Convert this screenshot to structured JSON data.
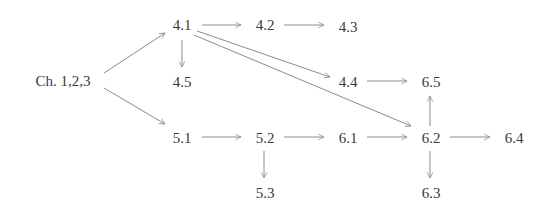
{
  "diagram": {
    "type": "dependency-graph",
    "nodes": [
      {
        "id": "ch123",
        "label": "Ch.  1,2,3",
        "x": 63,
        "y": 81
      },
      {
        "id": "4.1",
        "label": "4.1",
        "x": 182,
        "y": 25
      },
      {
        "id": "4.2",
        "label": "4.2",
        "x": 265,
        "y": 25
      },
      {
        "id": "4.3",
        "label": "4.3",
        "x": 348,
        "y": 27
      },
      {
        "id": "4.5",
        "label": "4.5",
        "x": 182,
        "y": 82
      },
      {
        "id": "4.4",
        "label": "4.4",
        "x": 348,
        "y": 82
      },
      {
        "id": "6.5",
        "label": "6.5",
        "x": 431,
        "y": 82
      },
      {
        "id": "5.1",
        "label": "5.1",
        "x": 182,
        "y": 138
      },
      {
        "id": "5.2",
        "label": "5.2",
        "x": 265,
        "y": 138
      },
      {
        "id": "6.1",
        "label": "6.1",
        "x": 348,
        "y": 138
      },
      {
        "id": "6.2",
        "label": "6.2",
        "x": 431,
        "y": 138
      },
      {
        "id": "6.4",
        "label": "6.4",
        "x": 514,
        "y": 138
      },
      {
        "id": "5.3",
        "label": "5.3",
        "x": 265,
        "y": 193
      },
      {
        "id": "6.3",
        "label": "6.3",
        "x": 431,
        "y": 193
      }
    ],
    "edges": [
      {
        "from": "ch123",
        "to": "4.1",
        "x1": 104,
        "y1": 73,
        "x2": 165,
        "y2": 33
      },
      {
        "from": "ch123",
        "to": "5.1",
        "x1": 104,
        "y1": 88,
        "x2": 165,
        "y2": 124
      },
      {
        "from": "4.1",
        "to": "4.2",
        "x1": 202,
        "y1": 25,
        "x2": 241,
        "y2": 25
      },
      {
        "from": "4.2",
        "to": "4.3",
        "x1": 284,
        "y1": 25,
        "x2": 324,
        "y2": 25
      },
      {
        "from": "4.1",
        "to": "4.5",
        "x1": 182,
        "y1": 40,
        "x2": 182,
        "y2": 67
      },
      {
        "from": "4.1",
        "to": "4.4",
        "x1": 197,
        "y1": 31,
        "x2": 330,
        "y2": 77
      },
      {
        "from": "4.1",
        "to": "6.2",
        "x1": 194,
        "y1": 35,
        "x2": 411,
        "y2": 126
      },
      {
        "from": "4.4",
        "to": "6.5",
        "x1": 367,
        "y1": 81,
        "x2": 407,
        "y2": 81
      },
      {
        "from": "6.2",
        "to": "6.5",
        "x1": 430,
        "y1": 126,
        "x2": 430,
        "y2": 96
      },
      {
        "from": "5.1",
        "to": "5.2",
        "x1": 202,
        "y1": 137,
        "x2": 241,
        "y2": 137
      },
      {
        "from": "5.2",
        "to": "5.3",
        "x1": 264,
        "y1": 151,
        "x2": 264,
        "y2": 178
      },
      {
        "from": "5.2",
        "to": "6.1",
        "x1": 284,
        "y1": 137,
        "x2": 324,
        "y2": 137
      },
      {
        "from": "6.1",
        "to": "6.2",
        "x1": 367,
        "y1": 137,
        "x2": 407,
        "y2": 137
      },
      {
        "from": "6.2",
        "to": "6.4",
        "x1": 450,
        "y1": 137,
        "x2": 490,
        "y2": 137
      },
      {
        "from": "6.2",
        "to": "6.3",
        "x1": 430,
        "y1": 151,
        "x2": 430,
        "y2": 178
      }
    ]
  },
  "colors": {
    "text": "#3a3a3a",
    "edge": "#8c8c8c",
    "background": "#ffffff"
  }
}
